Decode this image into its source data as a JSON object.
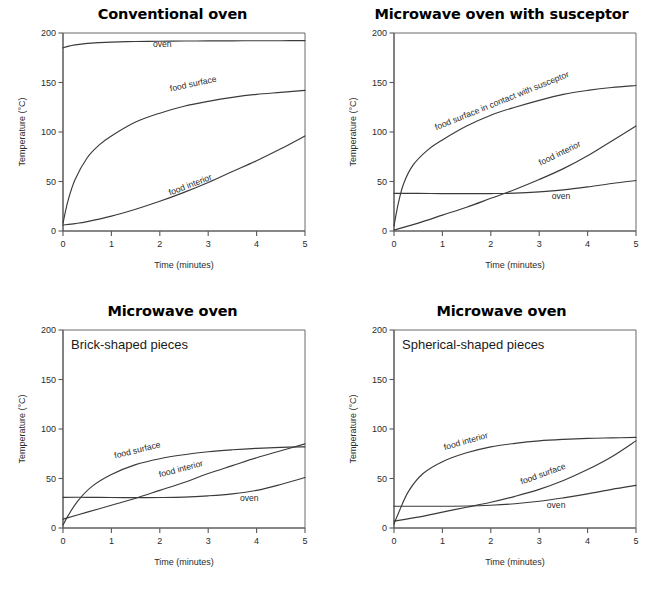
{
  "figure": {
    "background": "#ffffff",
    "ink_color": "#2b2b2b",
    "axis_color": "#5a5a5a",
    "curve_color": "#3a3a3a",
    "cut_off_header_sliver": ""
  },
  "chart_data": [
    {
      "id": "conventional-oven",
      "type": "line",
      "title": "Conventional oven",
      "inset_title": "",
      "xlabel": "Time (minutes)",
      "ylabel": "Temperature (°C)",
      "xlim": [
        0,
        5
      ],
      "ylim": [
        0,
        200
      ],
      "xticks": [
        "0",
        "1",
        "2",
        "3",
        "4",
        "5"
      ],
      "yticks": [
        "0",
        "50",
        "100",
        "150",
        "200"
      ],
      "grid": false,
      "legend_position": "inline-labels",
      "series": [
        {
          "name": "oven",
          "label": "oven",
          "label_x": 2.05,
          "label_y": 186,
          "label_rotation": 0,
          "x": [
            0,
            0.1,
            0.25,
            0.5,
            0.75,
            1,
            1.5,
            2,
            2.5,
            3,
            3.5,
            4,
            4.5,
            5
          ],
          "values": [
            185,
            186.5,
            188,
            189.5,
            190.3,
            190.8,
            191.4,
            191.7,
            191.9,
            192,
            192.1,
            192.2,
            192.2,
            192.3
          ]
        },
        {
          "name": "food surface",
          "label": "food surface",
          "label_x": 2.7,
          "label_y": 146,
          "label_rotation": -12,
          "x": [
            0,
            0.1,
            0.25,
            0.5,
            0.75,
            1,
            1.5,
            2,
            2.5,
            3,
            3.5,
            4,
            4.5,
            5
          ],
          "values": [
            8,
            30,
            52,
            74,
            87,
            96,
            110,
            119,
            126,
            131,
            135,
            138,
            140,
            142
          ]
        },
        {
          "name": "food interior",
          "label": "food interior",
          "label_x": 2.65,
          "label_y": 44,
          "label_rotation": -21,
          "x": [
            0,
            0.25,
            0.5,
            1,
            1.5,
            2,
            2.5,
            3,
            3.5,
            4,
            4.5,
            5
          ],
          "values": [
            6,
            7.5,
            9.5,
            15,
            22,
            30,
            39,
            49,
            60,
            71,
            83,
            96
          ]
        }
      ]
    },
    {
      "id": "microwave-oven-with-susceptor",
      "type": "line",
      "title": "Microwave oven with susceptor",
      "inset_title": "",
      "xlabel": "Time (minutes)",
      "ylabel": "Temperature (°C)",
      "xlim": [
        0,
        5
      ],
      "ylim": [
        0,
        200
      ],
      "xticks": [
        "0",
        "1",
        "2",
        "3",
        "4",
        "5"
      ],
      "yticks": [
        "0",
        "50",
        "100",
        "150",
        "200"
      ],
      "grid": false,
      "legend_position": "inline-labels",
      "series": [
        {
          "name": "food surface in contact with susceptor",
          "label": "food surface in contact with susceptor",
          "label_x": 2.25,
          "label_y": 129,
          "label_rotation": -22,
          "x": [
            0,
            0.08,
            0.2,
            0.4,
            0.7,
            1,
            1.5,
            2,
            2.5,
            3,
            3.5,
            4,
            4.5,
            5
          ],
          "values": [
            5,
            26,
            48,
            67,
            82,
            92,
            106,
            117,
            125,
            132,
            138,
            142,
            145,
            147
          ]
        },
        {
          "name": "food interior",
          "label": "food interior",
          "label_x": 3.45,
          "label_y": 76,
          "label_rotation": -26,
          "x": [
            0,
            0.5,
            1,
            1.5,
            2,
            2.5,
            3,
            3.5,
            4,
            4.5,
            5
          ],
          "values": [
            1,
            8,
            16,
            24,
            33,
            42,
            52,
            63,
            76,
            91,
            106
          ]
        },
        {
          "name": "oven",
          "label": "oven",
          "label_x": 3.45,
          "label_y": 32,
          "label_rotation": 0,
          "x": [
            0,
            0.5,
            1,
            1.5,
            2,
            2.5,
            3,
            3.5,
            4,
            4.5,
            5
          ],
          "values": [
            38,
            38,
            37.8,
            37.7,
            37.8,
            38.2,
            39.5,
            41.5,
            44.5,
            48,
            51
          ]
        }
      ]
    },
    {
      "id": "microwave-oven-brick-shaped",
      "type": "line",
      "title": "Microwave oven",
      "inset_title": "Brick-shaped pieces",
      "xlabel": "Time (minutes)",
      "ylabel": "Temperature (°C)",
      "xlim": [
        0,
        5
      ],
      "ylim": [
        0,
        200
      ],
      "xticks": [
        "0",
        "1",
        "2",
        "3",
        "4",
        "5"
      ],
      "yticks": [
        "0",
        "50",
        "100",
        "150",
        "200"
      ],
      "grid": false,
      "legend_position": "inline-labels",
      "series": [
        {
          "name": "food surface",
          "label": "food surface",
          "label_x": 1.55,
          "label_y": 76,
          "label_rotation": -14,
          "x": [
            0,
            0.1,
            0.3,
            0.6,
            1,
            1.5,
            2,
            2.5,
            3,
            3.5,
            4,
            4.5,
            5
          ],
          "values": [
            3,
            12,
            27,
            42,
            54,
            64,
            70,
            74,
            77,
            79,
            80.5,
            81.5,
            82
          ]
        },
        {
          "name": "food interior",
          "label": "food interior",
          "label_x": 2.45,
          "label_y": 57,
          "label_rotation": -15,
          "x": [
            0,
            0.5,
            1,
            1.5,
            2,
            2.5,
            3,
            3.5,
            4,
            4.5,
            5
          ],
          "values": [
            9,
            16,
            23,
            30,
            38,
            46,
            55,
            63,
            71,
            78,
            85
          ]
        },
        {
          "name": "oven",
          "label": "oven",
          "label_x": 3.85,
          "label_y": 27,
          "label_rotation": 0,
          "x": [
            0,
            0.5,
            1,
            1.5,
            2,
            2.5,
            3,
            3.5,
            4,
            4.5,
            5
          ],
          "values": [
            31,
            31,
            30.8,
            30.7,
            30.8,
            31.2,
            32.5,
            34.5,
            38,
            44,
            51
          ]
        }
      ]
    },
    {
      "id": "microwave-oven-spherical-shaped",
      "type": "line",
      "title": "Microwave oven",
      "inset_title": "Spherical-shaped pieces",
      "xlabel": "Time (minutes)",
      "ylabel": "Temperature (°C)",
      "xlim": [
        0,
        5
      ],
      "ylim": [
        0,
        200
      ],
      "xticks": [
        "0",
        "1",
        "2",
        "3",
        "4",
        "5"
      ],
      "yticks": [
        "0",
        "50",
        "100",
        "150",
        "200"
      ],
      "grid": false,
      "legend_position": "inline-labels",
      "series": [
        {
          "name": "food interior",
          "label": "food interior",
          "label_x": 1.5,
          "label_y": 85,
          "label_rotation": -16,
          "x": [
            0,
            0.1,
            0.3,
            0.6,
            1,
            1.5,
            2,
            2.5,
            3,
            3.5,
            4,
            4.5,
            5
          ],
          "values": [
            4,
            16,
            37,
            55,
            67,
            76,
            82,
            85.5,
            88,
            89.5,
            90.5,
            91,
            91.5
          ]
        },
        {
          "name": "food surface",
          "label": "food surface",
          "label_x": 3.1,
          "label_y": 52,
          "label_rotation": -20,
          "x": [
            0,
            0.5,
            1,
            1.5,
            2,
            2.5,
            3,
            3.5,
            4,
            4.5,
            5
          ],
          "values": [
            7,
            11,
            16,
            21,
            26,
            32,
            39,
            48,
            59,
            72,
            88
          ]
        },
        {
          "name": "oven",
          "label": "oven",
          "label_x": 3.35,
          "label_y": 20,
          "label_rotation": 0,
          "x": [
            0,
            0.5,
            1,
            1.5,
            2,
            2.5,
            3,
            3.5,
            4,
            4.5,
            5
          ],
          "values": [
            22,
            22,
            22,
            22.2,
            23,
            24.5,
            27,
            30.5,
            34.5,
            39,
            43
          ]
        }
      ]
    }
  ]
}
